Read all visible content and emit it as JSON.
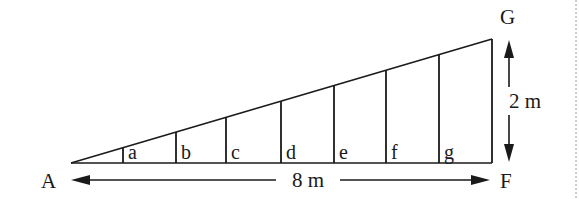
{
  "diagram": {
    "points": {
      "apex_label": "A",
      "top_right_label": "G",
      "bottom_right_label": "F"
    },
    "dimensions": {
      "base_length": "8 m",
      "height": "2 m"
    },
    "supports": [
      {
        "label": "a"
      },
      {
        "label": "b"
      },
      {
        "label": "c"
      },
      {
        "label": "d"
      },
      {
        "label": "e"
      },
      {
        "label": "f"
      },
      {
        "label": "g"
      }
    ],
    "colors": {
      "line": "#1a1a1a",
      "background": "#ffffff"
    }
  }
}
